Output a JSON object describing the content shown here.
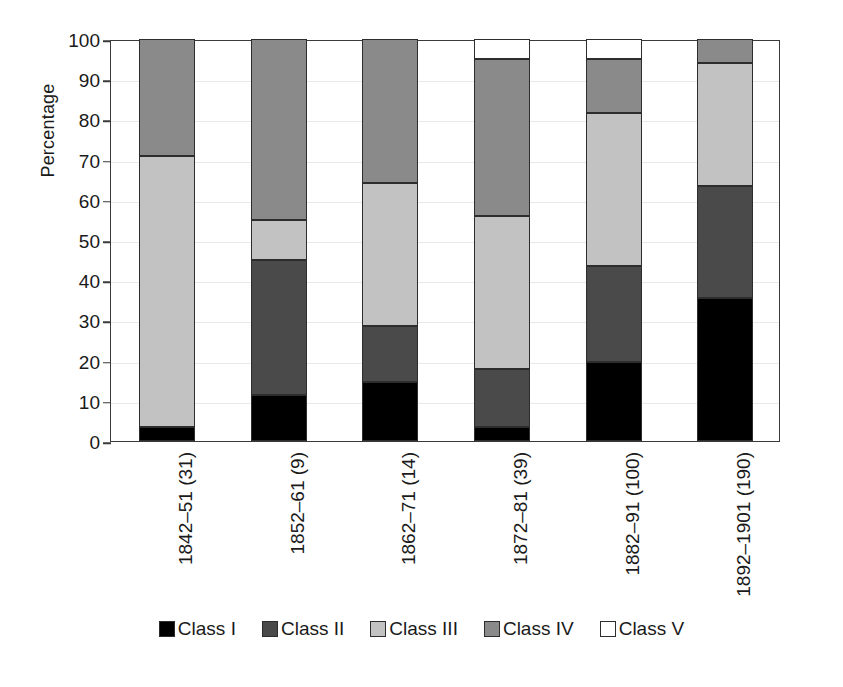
{
  "chart_data": {
    "type": "bar",
    "subtype": "stacked-100-percent",
    "title": "",
    "xlabel": "",
    "ylabel": "Percentage",
    "ylim": [
      0,
      100
    ],
    "yticks": [
      0,
      10,
      20,
      30,
      40,
      50,
      60,
      70,
      80,
      90,
      100
    ],
    "grid": true,
    "legend_position": "bottom",
    "categories": [
      "1842–51 (31)",
      "1852–61 (9)",
      "1862–71 (14)",
      "1872–81 (39)",
      "1882–91 (100)",
      "1892–1901 (190)"
    ],
    "series": [
      {
        "name": "Class I",
        "color": "#000000",
        "values": [
          3.5,
          11.5,
          14.7,
          3.5,
          19.7,
          35.5
        ]
      },
      {
        "name": "Class II",
        "color": "#4a4a4a",
        "values": [
          0.0,
          33.5,
          13.9,
          14.5,
          23.8,
          28.0
        ]
      },
      {
        "name": "Class III",
        "color": "#c2c2c2",
        "values": [
          67.5,
          10.0,
          35.7,
          38.0,
          38.0,
          30.5
        ]
      },
      {
        "name": "Class IV",
        "color": "#8a8a8a",
        "values": [
          29.0,
          45.0,
          35.7,
          39.0,
          13.5,
          6.0
        ]
      },
      {
        "name": "Class V",
        "color": "#ffffff",
        "values": [
          0.0,
          0.0,
          0.0,
          5.0,
          5.0,
          0.0
        ]
      }
    ],
    "stack_boundaries": [
      [
        3.5,
        3.5,
        71.0,
        100.0,
        100.0
      ],
      [
        11.5,
        45.0,
        55.0,
        100.0,
        100.0
      ],
      [
        14.7,
        28.6,
        64.3,
        100.0,
        100.0
      ],
      [
        3.5,
        18.0,
        56.0,
        95.0,
        100.0
      ],
      [
        19.7,
        43.5,
        81.5,
        95.0,
        100.0
      ],
      [
        35.5,
        63.5,
        94.0,
        100.0,
        100.0
      ]
    ]
  },
  "legend": {
    "items": [
      {
        "label": "Class I",
        "color": "#000000"
      },
      {
        "label": "Class II",
        "color": "#4a4a4a"
      },
      {
        "label": "Class III",
        "color": "#c2c2c2"
      },
      {
        "label": "Class IV",
        "color": "#8a8a8a"
      },
      {
        "label": "Class V",
        "color": "#ffffff"
      }
    ]
  }
}
